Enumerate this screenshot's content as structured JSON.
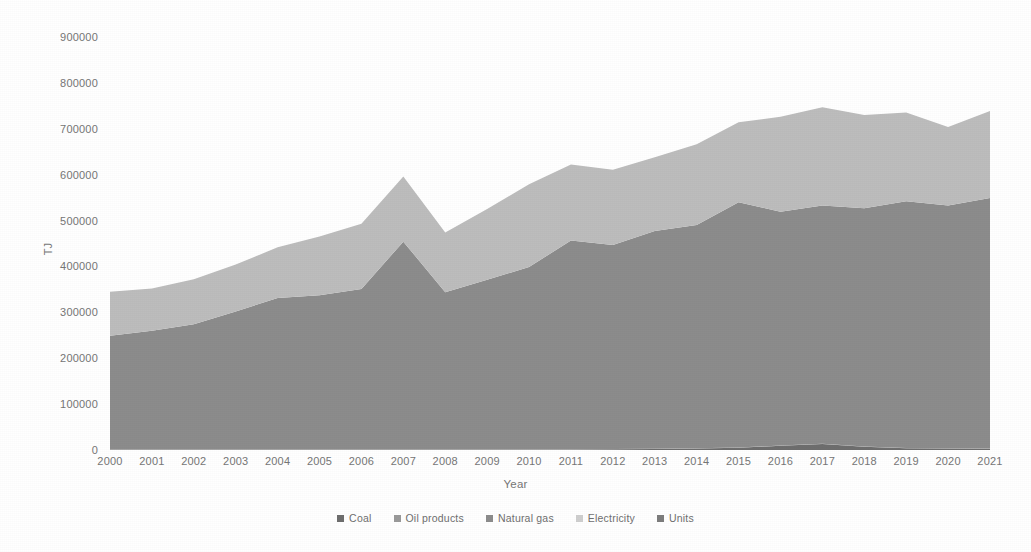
{
  "chart_data": {
    "type": "area",
    "stacked": true,
    "title": "",
    "xlabel": "Year",
    "ylabel": "TJ",
    "grid": false,
    "legend_position": "bottom",
    "categories": [
      2000,
      2001,
      2002,
      2003,
      2004,
      2005,
      2006,
      2007,
      2008,
      2009,
      2010,
      2011,
      2012,
      2013,
      2014,
      2015,
      2016,
      2017,
      2018,
      2019,
      2020,
      2021
    ],
    "xtick_labels": [
      "2000",
      "2001",
      "2002",
      "2003",
      "2004",
      "2005",
      "2006",
      "2007",
      "2008",
      "2009",
      "2010",
      "2011",
      "2012",
      "2013",
      "2014",
      "2015",
      "2016",
      "2017",
      "2018",
      "2019",
      "2020",
      "2021"
    ],
    "ytick_labels": [
      "0",
      "100000",
      "200000",
      "300000",
      "400000",
      "500000",
      "600000",
      "700000",
      "800000",
      "900000"
    ],
    "ylim": [
      0,
      900000
    ],
    "ytick_values": [
      0,
      100000,
      200000,
      300000,
      400000,
      500000,
      600000,
      700000,
      800000,
      900000
    ],
    "series": [
      {
        "name": "Coal",
        "color": "#6e6e6e",
        "values": [
          900,
          900,
          900,
          900,
          1000,
          1000,
          1100,
          1200,
          1100,
          1000,
          1100,
          1200,
          1500,
          2000,
          3000,
          5000,
          9000,
          13000,
          7000,
          4000,
          3000,
          2500
        ]
      },
      {
        "name": "Oil products",
        "color": "#9a9a9a",
        "values": [
          600,
          600,
          600,
          600,
          600,
          600,
          600,
          600,
          600,
          600,
          600,
          600,
          600,
          600,
          600,
          600,
          600,
          600,
          600,
          600,
          600,
          600
        ]
      },
      {
        "name": "Natural gas",
        "color": "#8c8c8c",
        "values": [
          247500,
          258400,
          272500,
          300500,
          329400,
          335900,
          349400,
          452200,
          342300,
          369400,
          396900,
          454900,
          444900,
          474900,
          486900,
          534400,
          509400,
          519400,
          519400,
          537400,
          529400,
          545900
        ]
      },
      {
        "name": "Electricity",
        "color": "#bdbdbd",
        "values": [
          96000,
          92100,
          98000,
          102000,
          110600,
          127500,
          142100,
          142000,
          130000,
          154000,
          180500,
          165500,
          163500,
          160500,
          175600,
          174000,
          207000,
          214000,
          203000,
          193600,
          171000,
          190000
        ]
      },
      {
        "name": "Units",
        "color": "#7d7d7d",
        "values": [
          0,
          0,
          0,
          0,
          0,
          0,
          0,
          0,
          0,
          0,
          0,
          0,
          0,
          0,
          0,
          0,
          0,
          0,
          0,
          0,
          0,
          0
        ]
      }
    ],
    "totals": [
      345000,
      352000,
      372000,
      404000,
      441600,
      465000,
      493200,
      596000,
      474000,
      525000,
      579100,
      622200,
      610500,
      638000,
      666100,
      714000,
      726000,
      747000,
      730000,
      735600,
      704000,
      739000
    ]
  },
  "legend": {
    "items": [
      {
        "label": "Coal",
        "color": "#6e6e6e",
        "icon": "legend-swatch-icon"
      },
      {
        "label": "Oil products",
        "color": "#9a9a9a",
        "icon": "legend-swatch-icon"
      },
      {
        "label": "Natural gas",
        "color": "#8c8c8c",
        "icon": "legend-swatch-icon"
      },
      {
        "label": "Electricity",
        "color": "#cfcfcf",
        "icon": "legend-swatch-icon"
      },
      {
        "label": "Units",
        "color": "#7d7d7d",
        "icon": "legend-swatch-icon"
      }
    ]
  },
  "style": {
    "background": "#ffffff",
    "text_color": "#767676"
  }
}
